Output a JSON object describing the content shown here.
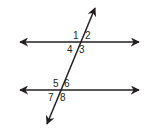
{
  "diagram": {
    "type": "parallel lines cut by a transversal",
    "line_color": "#231f20",
    "angles_top": [
      "1",
      "2",
      "4",
      "3"
    ],
    "angles_bottom": [
      "5",
      "6",
      "7",
      "8"
    ]
  }
}
